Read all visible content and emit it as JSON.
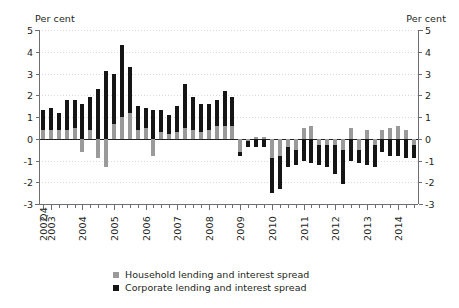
{
  "chart_data": {
    "type": "bar",
    "title": "",
    "subtitle": "",
    "stacked": true,
    "xlabel": "",
    "ylabel": "Per cent",
    "ylabel_right": "Per cent",
    "ylim": [
      -3,
      5
    ],
    "yticks": [
      5,
      4,
      3,
      2,
      1,
      0,
      -1,
      -2,
      -3
    ],
    "grid": true,
    "legend_position": "bottom-center",
    "x_axis_note": "Quarterly data; first observation 2002 Q4",
    "categories": [
      "2002 Q4",
      "2003 Q1",
      "2003 Q2",
      "2003 Q3",
      "2003 Q4",
      "2004 Q1",
      "2004 Q2",
      "2004 Q3",
      "2004 Q4",
      "2005 Q1",
      "2005 Q2",
      "2005 Q3",
      "2005 Q4",
      "2006 Q1",
      "2006 Q2",
      "2006 Q3",
      "2006 Q4",
      "2007 Q1",
      "2007 Q2",
      "2007 Q3",
      "2007 Q4",
      "2008 Q1",
      "2008 Q2",
      "2008 Q3",
      "2008 Q4",
      "2009 Q1",
      "2009 Q2",
      "2009 Q3",
      "2009 Q4",
      "2010 Q1",
      "2010 Q2",
      "2010 Q3",
      "2010 Q4",
      "2011 Q1",
      "2011 Q2",
      "2011 Q3",
      "2011 Q4",
      "2012 Q1",
      "2012 Q2",
      "2012 Q3",
      "2012 Q4",
      "2013 Q1",
      "2013 Q2",
      "2013 Q3",
      "2013 Q4",
      "2014 Q1",
      "2014 Q2",
      "2014 Q3"
    ],
    "tick_labels": [
      {
        "label": "2002",
        "index": 0
      },
      {
        "label": "2003",
        "index": 1
      },
      {
        "label": "2004",
        "index": 5
      },
      {
        "label": "2005",
        "index": 9
      },
      {
        "label": "2006",
        "index": 13
      },
      {
        "label": "2007",
        "index": 17
      },
      {
        "label": "2008",
        "index": 21
      },
      {
        "label": "2009",
        "index": 25
      },
      {
        "label": "2010",
        "index": 29
      },
      {
        "label": "2011",
        "index": 33
      },
      {
        "label": "2012",
        "index": 37
      },
      {
        "label": "2013",
        "index": 41
      },
      {
        "label": "2014",
        "index": 45
      }
    ],
    "first_tick_quarter": "Q4",
    "series": [
      {
        "name": "Household lending and interest spread",
        "color": "#9a9a9a",
        "values": [
          0.4,
          0.4,
          0.4,
          0.4,
          0.5,
          -0.6,
          0.4,
          -0.9,
          -1.3,
          0.7,
          1.0,
          1.2,
          0.4,
          0.5,
          -0.8,
          0.3,
          0.2,
          0.3,
          0.5,
          0.4,
          0.3,
          0.4,
          0.6,
          0.6,
          0.6,
          -0.6,
          -0.1,
          0.1,
          0.1,
          -0.9,
          -0.8,
          -0.4,
          -0.5,
          0.5,
          0.6,
          -0.3,
          -0.3,
          -0.3,
          -0.5,
          0.5,
          -0.5,
          0.4,
          -0.3,
          0.4,
          0.5,
          0.6,
          0.4,
          -0.3
        ]
      },
      {
        "name": "Corporate lending and interest spread",
        "color": "#151515",
        "values": [
          0.9,
          1.0,
          0.8,
          1.4,
          1.3,
          1.6,
          1.5,
          2.3,
          3.1,
          2.3,
          3.3,
          2.1,
          1.1,
          0.9,
          1.3,
          1.0,
          0.9,
          1.2,
          2.0,
          1.5,
          1.3,
          1.2,
          1.2,
          1.6,
          1.3,
          -0.2,
          -0.3,
          -0.4,
          -0.4,
          -1.6,
          -1.5,
          -0.9,
          -0.7,
          -1.0,
          -1.1,
          -0.9,
          -1.0,
          -1.3,
          -1.6,
          -1.0,
          -0.6,
          -1.2,
          -1.0,
          -0.6,
          -0.8,
          -0.8,
          -0.9,
          -0.6
        ]
      }
    ]
  },
  "legend": {
    "items": [
      {
        "label": "Household lending and interest spread",
        "color": "#9a9a9a"
      },
      {
        "label": "Corporate lending and interest spread",
        "color": "#151515"
      }
    ]
  },
  "axis": {
    "unit_left": "Per cent",
    "unit_right": "Per cent"
  }
}
